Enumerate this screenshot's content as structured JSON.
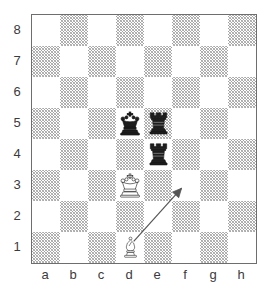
{
  "diagram": {
    "kind": "chess-board-diagram",
    "board": {
      "files": [
        "a",
        "b",
        "c",
        "d",
        "e",
        "f",
        "g",
        "h"
      ],
      "ranks": [
        "8",
        "7",
        "6",
        "5",
        "4",
        "3",
        "2",
        "1"
      ],
      "light_square_color": "#ffffff",
      "dark_square_color": "#b4b4b4",
      "border_color": "#6e6e6e",
      "label_color": "#3b3b3b",
      "squares_per_side": 8
    },
    "pieces": [
      {
        "id": "black-king-d5",
        "piece": "king",
        "color": "black",
        "glyph": "♚",
        "file": "d",
        "rank": "5",
        "square": "d5",
        "name": "black-king"
      },
      {
        "id": "black-rook-e5",
        "piece": "rook",
        "color": "black",
        "glyph": "♜",
        "file": "e",
        "rank": "5",
        "square": "e5",
        "name": "black-rook"
      },
      {
        "id": "black-rook-e4",
        "piece": "rook",
        "color": "black",
        "glyph": "♜",
        "file": "e",
        "rank": "4",
        "square": "e4",
        "name": "black-rook"
      },
      {
        "id": "white-king-d3",
        "piece": "king",
        "color": "white",
        "glyph": "♔",
        "file": "d",
        "rank": "3",
        "square": "d3",
        "name": "white-king"
      },
      {
        "id": "white-bishop-d1",
        "piece": "bishop",
        "color": "white",
        "glyph": "♗",
        "file": "d",
        "rank": "1",
        "square": "d1",
        "name": "white-bishop"
      }
    ],
    "arrows": [
      {
        "id": "move-arrow",
        "name": "move-arrow-d1-f3",
        "from_square": "d1",
        "to_square": "f3",
        "color": "#555555",
        "style": "thin-line-with-open-arrowhead"
      }
    ]
  }
}
